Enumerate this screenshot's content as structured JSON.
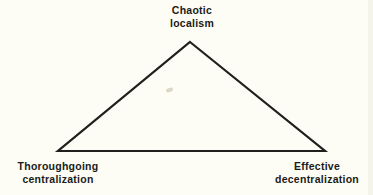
{
  "figure": {
    "background_color": "#fdfdf5",
    "ink_color": "#1b1b18",
    "width": 373,
    "height": 195
  },
  "diagram": {
    "type": "triangle",
    "stroke_color": "#201f1c",
    "stroke_width": 2.2,
    "vertices": {
      "apex": {
        "x": 190,
        "y": 42
      },
      "bottom_left": {
        "x": 58,
        "y": 151
      },
      "bottom_right": {
        "x": 325,
        "y": 151
      }
    }
  },
  "labels": {
    "apex": "Chaotic\nlocalism",
    "bottom_left": "Thoroughgoing\ncentralization",
    "bottom_right": "Effective\ndecentralization"
  },
  "artifacts": {
    "speck_color": "#cfcbb8",
    "scan_edge_color": "#f3f2e8"
  }
}
